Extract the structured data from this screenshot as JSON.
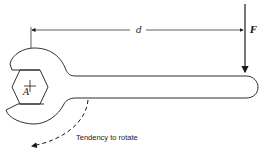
{
  "diagram": {
    "labels": {
      "distance": "d",
      "force": "F",
      "pivot": "A",
      "rotation": "Tendency to rotate"
    },
    "colors": {
      "stroke": "#1a1a1a",
      "background": "#ffffff"
    }
  }
}
